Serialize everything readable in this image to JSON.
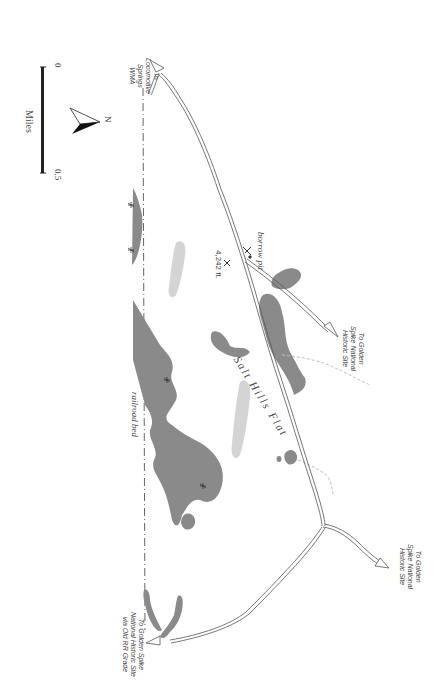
{
  "map": {
    "title_feature": "Salt Hills Flat",
    "labels": {
      "locomotive": [
        "To",
        "Locomotive",
        "Springs",
        "WMA"
      ],
      "golden_spike_upper": [
        "To Golden",
        "Spike National",
        "Historic Site"
      ],
      "golden_spike_right": [
        "To Golden",
        "Spike National",
        "Historic Site"
      ],
      "golden_spike_old_rr": [
        "To Golden Spike",
        "National Historic Site",
        "via Old RR Grade"
      ],
      "borrow_pit": "borrow pit",
      "elevation": "4,242 ft.",
      "railroad_bed": "railroad bed",
      "salt_hills_flat": "Salt Hills Flat"
    },
    "scale": {
      "start": "0",
      "end": "0.5",
      "unit": "Miles"
    },
    "north_arrow": "N",
    "colors": {
      "wetland": "#8a8a8a",
      "pale_area": "#d6d6d6",
      "road": "#555555",
      "dashed_track": "#b0b0b0",
      "railroad": "#666666"
    }
  }
}
